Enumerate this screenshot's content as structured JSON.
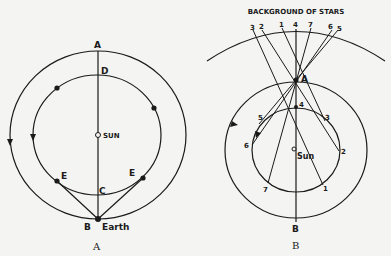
{
  "diagram_a": {
    "caption": "A",
    "labels": {
      "top": "A",
      "inner_top": "D",
      "sun": "SUN",
      "inner_bottom": "C",
      "bottom": "B",
      "earth": "Earth",
      "left_e": "E",
      "right_e": "E"
    }
  },
  "diagram_b": {
    "caption": "B",
    "title": "BACKGROUND OF STARS",
    "labels": {
      "top": "A",
      "bottom": "B",
      "sun": "Sun"
    },
    "star_labels": [
      "3",
      "2",
      "1",
      "4",
      "7",
      "6",
      "5"
    ],
    "orbit_labels": [
      "5",
      "4",
      "3",
      "6",
      "2",
      "7",
      "1"
    ]
  }
}
